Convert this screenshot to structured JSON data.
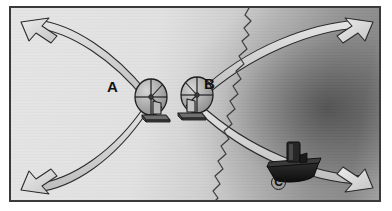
{
  "figure": {
    "type": "physics-diagram",
    "width": 392,
    "height": 211,
    "border_color": "#3a3a3a",
    "background_light": "#e6e6e6",
    "background_dark": "#8e8e8e"
  },
  "labels": {
    "source_a": "A",
    "source_b": "B",
    "boat_c": "C"
  },
  "sources": [
    {
      "id": "A",
      "name": "wave-source-a",
      "label": "A",
      "cx": 140,
      "cy": 91,
      "radius": 17,
      "description": "propeller wave generator on stand"
    },
    {
      "id": "B",
      "name": "wave-source-b",
      "label": "B",
      "cx": 185,
      "cy": 89,
      "radius": 17,
      "description": "propeller wave generator on stand"
    }
  ],
  "boat": {
    "name": "boat-c",
    "label": "C",
    "x": 281,
    "y": 160,
    "color": "#1c1c1c"
  },
  "arrows": {
    "count": 4,
    "style": "hollow-outlined-arrowhead",
    "fill": "#dcdcdc",
    "stroke": "#2b2b2b",
    "directions": [
      "up-left",
      "up-right",
      "down-left",
      "down-right"
    ]
  },
  "curves": {
    "name": "hyperbolic-interference-bands",
    "band_fill": "#d2d2d2",
    "band_stroke": "#2b2b2b",
    "count": 4,
    "description": "two pairs of hyperbolic nodal lines radiating from between the two sources"
  },
  "wavefront": {
    "name": "jagged-wavefront-line",
    "stroke": "#3a3a3a",
    "description": "vertical zigzag line to the right of source B"
  },
  "colors": {
    "ink": "#2b2b2b",
    "label_text": "#111111",
    "boat_dark": "#1c1c1c",
    "device_gray": "#9a9a9a"
  }
}
